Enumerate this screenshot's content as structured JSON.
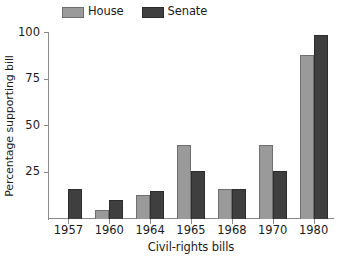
{
  "chart_data": {
    "type": "bar",
    "title": "",
    "subtitle": "",
    "xlabel": "Civil-rights bills",
    "ylabel": "Percentage supporting bill",
    "categories": [
      "1957",
      "1960",
      "1964",
      "1965",
      "1968",
      "1970",
      "1980"
    ],
    "series": [
      {
        "name": "House",
        "color": "#9a9a9a",
        "values": [
          null,
          5,
          13,
          40,
          16,
          40,
          88
        ]
      },
      {
        "name": "Senate",
        "color": "#3f3f3f",
        "values": [
          16,
          10,
          15,
          26,
          16,
          26,
          99
        ]
      }
    ],
    "ylim": [
      0,
      100
    ],
    "yticks": [
      25,
      50,
      75,
      100
    ],
    "ytick_labels": [
      "25",
      "50",
      "75",
      "100"
    ],
    "grid": false,
    "legend_position": "top-left",
    "legend_entries": [
      "House",
      "Senate"
    ],
    "annotations": []
  }
}
